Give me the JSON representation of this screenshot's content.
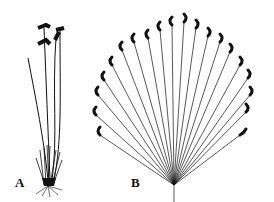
{
  "figure": {
    "panels": [
      {
        "label": "A",
        "description": "Whole plant with tufted base, roots and four long stalks bearing spikes"
      },
      {
        "label": "B",
        "description": "Enlarged fan-shaped cluster of many stalks with dark curled spike tips"
      }
    ]
  },
  "colors": {
    "ink": "#111111",
    "background": "#ffffff"
  }
}
